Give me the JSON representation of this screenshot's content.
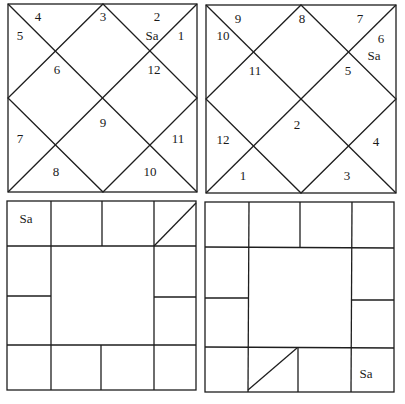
{
  "charts": [
    {
      "id": "north-chart-1",
      "style": "north-indian-diamond",
      "houses": [
        {
          "sign": "3",
          "x": 103,
          "y": 21
        },
        {
          "sign": "2",
          "x": 157,
          "y": 21
        },
        {
          "sign": "Sa",
          "x": 152,
          "y": 40
        },
        {
          "sign": "1",
          "x": 181,
          "y": 40
        },
        {
          "sign": "4",
          "x": 38,
          "y": 21
        },
        {
          "sign": "5",
          "x": 20,
          "y": 40
        },
        {
          "sign": "6",
          "x": 57,
          "y": 74
        },
        {
          "sign": "12",
          "x": 154,
          "y": 74
        },
        {
          "sign": "9",
          "x": 103,
          "y": 127
        },
        {
          "sign": "7",
          "x": 20,
          "y": 143
        },
        {
          "sign": "11",
          "x": 178,
          "y": 143
        },
        {
          "sign": "8",
          "x": 56,
          "y": 176
        },
        {
          "sign": "10",
          "x": 150,
          "y": 176
        }
      ]
    },
    {
      "id": "north-chart-2",
      "style": "north-indian-diamond",
      "houses": [
        {
          "sign": "9",
          "x": 238,
          "y": 23
        },
        {
          "sign": "10",
          "x": 223,
          "y": 40
        },
        {
          "sign": "8",
          "x": 302,
          "y": 23
        },
        {
          "sign": "7",
          "x": 360,
          "y": 23
        },
        {
          "sign": "6",
          "x": 381,
          "y": 43
        },
        {
          "sign": "Sa",
          "x": 374,
          "y": 60
        },
        {
          "sign": "11",
          "x": 255,
          "y": 75
        },
        {
          "sign": "5",
          "x": 348,
          "y": 75
        },
        {
          "sign": "2",
          "x": 297,
          "y": 129
        },
        {
          "sign": "12",
          "x": 223,
          "y": 144
        },
        {
          "sign": "4",
          "x": 376,
          "y": 146
        },
        {
          "sign": "1",
          "x": 243,
          "y": 180
        },
        {
          "sign": "3",
          "x": 347,
          "y": 180
        }
      ]
    },
    {
      "id": "south-chart-1",
      "style": "south-indian-grid",
      "labels": [
        {
          "text": "Sa",
          "x": 26,
          "y": 223
        }
      ]
    },
    {
      "id": "south-chart-2",
      "style": "south-indian-grid",
      "labels": [
        {
          "text": "Sa",
          "x": 366,
          "y": 378
        }
      ]
    }
  ]
}
